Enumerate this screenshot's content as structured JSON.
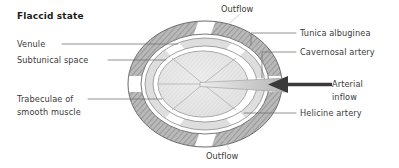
{
  "figure": {
    "title": "Flaccid state",
    "type": "anatomical-cross-section",
    "colors": {
      "tunica_albuginea_fill": "#b9b9b9",
      "tunica_albuginea_hatch": "#8c8c8c",
      "subtunical_space_fill": "#dcdcdc",
      "trabecular_fill": "#e6e6e6",
      "outline": "#5a5a5a",
      "leader_line": "#6d6d6d",
      "arrow": "#3a3a3a",
      "cavernosal_artery_fill": "#cfcfcf",
      "label_text": "#3a3a3a",
      "title_text": "#1c1c1c",
      "background": "#ffffff"
    },
    "labels": {
      "left": [
        {
          "id": "venule",
          "text": "Venule"
        },
        {
          "id": "subtunical-space",
          "text": "Subtunical space"
        },
        {
          "id": "trabeculae",
          "text": "Trabeculae of\nsmooth muscle"
        }
      ],
      "right": [
        {
          "id": "tunica-albuginea",
          "text": "Tunica albuginea"
        },
        {
          "id": "cavernosal-artery",
          "text": "Cavernosal artery"
        },
        {
          "id": "arterial-inflow",
          "text": "Arterial\ninflow"
        },
        {
          "id": "helicine-artery",
          "text": "Helicine artery"
        }
      ],
      "top": {
        "id": "outflow-top",
        "text": "Outflow"
      },
      "bottom": {
        "id": "outflow-bottom",
        "text": "Outflow"
      }
    },
    "annotations": {
      "arrow_direction": "left",
      "arrow_meaning": "Arterial inflow entering the corpus cavernosum"
    }
  }
}
